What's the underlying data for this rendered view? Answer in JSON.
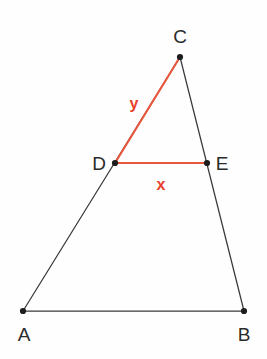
{
  "figure": {
    "background_color": "#fefefe",
    "line_color": "#3a3a3a",
    "accent_color": "#e8563c",
    "label_color": "#2b2b2b",
    "accent_label_color": "#e8402a"
  },
  "points": {
    "A": {
      "label": "A",
      "x": 23,
      "y": 311,
      "label_x": 24,
      "label_y": 341
    },
    "B": {
      "label": "B",
      "x": 244,
      "y": 311,
      "label_x": 244,
      "label_y": 341
    },
    "C": {
      "label": "C",
      "x": 180,
      "y": 57,
      "label_x": 180,
      "label_y": 43
    },
    "D": {
      "label": "D",
      "x": 115,
      "y": 163,
      "label_x": 99,
      "label_y": 170
    },
    "E": {
      "label": "E",
      "x": 207,
      "y": 163,
      "label_x": 222,
      "label_y": 170
    }
  },
  "segments": {
    "AB": {
      "name": "base-segment-AB",
      "from": "A",
      "to": "B",
      "style": "plain"
    },
    "AC": {
      "name": "left-side-segment-AC",
      "from": "A",
      "to": "C",
      "style": "plain"
    },
    "CB": {
      "name": "right-side-segment-CB",
      "from": "C",
      "to": "B",
      "style": "plain"
    },
    "DC": {
      "name": "accent-segment-DC",
      "from": "D",
      "to": "C",
      "style": "accent"
    },
    "DE": {
      "name": "accent-segment-DE",
      "from": "D",
      "to": "E",
      "style": "accent"
    }
  },
  "measure_labels": {
    "y": {
      "text": "y",
      "x": 134,
      "y": 109
    },
    "x": {
      "text": "x",
      "x": 161,
      "y": 190
    }
  }
}
